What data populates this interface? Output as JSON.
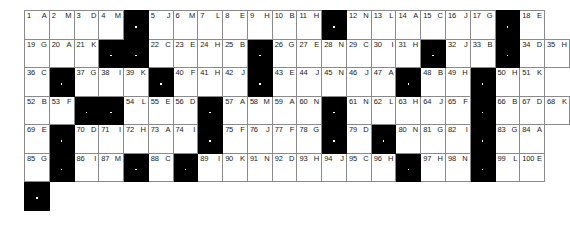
{
  "puzzle": {
    "type": "acrostic-grid",
    "title": "Acrostic Puzzle Grid",
    "columns": 20,
    "rows": 7,
    "cell_width_px": 26.8,
    "cell_height_px": 27.5,
    "origin_px": [
      24,
      10
    ],
    "colors": {
      "block": "#000000",
      "cell_fill": "#ffffff",
      "grid_line": "#8a8a8a",
      "text": "#1a1a1a"
    },
    "legend": {
      "number_position": "top-left",
      "clue_letter_position": "top-right"
    },
    "rows_data": [
      [
        {
          "n": "1",
          "c": "A"
        },
        {
          "n": "2",
          "c": "M"
        },
        {
          "n": "3",
          "c": "D"
        },
        {
          "n": "4",
          "c": "M"
        },
        {
          "blk": true
        },
        {
          "n": "5",
          "c": "J"
        },
        {
          "n": "6",
          "c": "M"
        },
        {
          "n": "7",
          "c": "L"
        },
        {
          "n": "8",
          "c": "E"
        },
        {
          "n": "9",
          "c": "H"
        },
        {
          "n": "10",
          "c": "B"
        },
        {
          "n": "11",
          "c": "H"
        },
        {
          "blk": true
        },
        {
          "n": "12",
          "c": "N"
        },
        {
          "n": "13",
          "c": "L"
        },
        {
          "n": "14",
          "c": "A"
        },
        {
          "n": "15",
          "c": "C"
        },
        {
          "n": "16",
          "c": "J"
        },
        {
          "n": "17",
          "c": "G"
        },
        {
          "blk": true
        },
        {
          "n": "18",
          "c": "E"
        }
      ],
      [
        {
          "n": "19",
          "c": "G"
        },
        {
          "n": "20",
          "c": "A"
        },
        {
          "n": "21",
          "c": "K"
        },
        {
          "blk": true
        },
        {
          "blk": true
        },
        {
          "n": "22",
          "c": "C"
        },
        {
          "n": "23",
          "c": "E"
        },
        {
          "n": "24",
          "c": "H"
        },
        {
          "n": "25",
          "c": "B"
        },
        {
          "blk": true
        },
        {
          "n": "26",
          "c": "G"
        },
        {
          "n": "27",
          "c": "E"
        },
        {
          "n": "28",
          "c": "N"
        },
        {
          "n": "29",
          "c": "C"
        },
        {
          "n": "30",
          "c": "I"
        },
        {
          "n": "31",
          "c": "H"
        },
        {
          "blk": true
        },
        {
          "n": "32",
          "c": "J"
        },
        {
          "n": "33",
          "c": "B"
        },
        {
          "blk": true
        },
        {
          "n": "34",
          "c": "D"
        },
        {
          "n": "35",
          "c": "H"
        }
      ],
      [
        {
          "n": "36",
          "c": "C"
        },
        {
          "blk": true
        },
        {
          "n": "37",
          "c": "G"
        },
        {
          "n": "38",
          "c": "I"
        },
        {
          "n": "39",
          "c": "K"
        },
        {
          "blk": true
        },
        {
          "n": "40",
          "c": "F"
        },
        {
          "n": "41",
          "c": "H"
        },
        {
          "n": "42",
          "c": "J"
        },
        {
          "blk": true
        },
        {
          "n": "43",
          "c": "E"
        },
        {
          "n": "44",
          "c": "J"
        },
        {
          "n": "45",
          "c": "N"
        },
        {
          "n": "46",
          "c": "J"
        },
        {
          "n": "47",
          "c": "A"
        },
        {
          "blk": true
        },
        {
          "n": "48",
          "c": "B"
        },
        {
          "n": "49",
          "c": "H"
        },
        {
          "blk": true
        },
        {
          "n": "50",
          "c": "H"
        },
        {
          "n": "51",
          "c": "K"
        }
      ],
      [
        {
          "n": "52",
          "c": "B"
        },
        {
          "n": "53",
          "c": "F"
        },
        {
          "blk": true
        },
        {
          "blk": true
        },
        {
          "n": "54",
          "c": "L"
        },
        {
          "n": "55",
          "c": "E"
        },
        {
          "n": "56",
          "c": "D"
        },
        {
          "blk": true
        },
        {
          "n": "57",
          "c": "A"
        },
        {
          "n": "58",
          "c": "M"
        },
        {
          "n": "59",
          "c": "A"
        },
        {
          "n": "60",
          "c": "N"
        },
        {
          "blk": true
        },
        {
          "n": "61",
          "c": "N"
        },
        {
          "n": "62",
          "c": "L"
        },
        {
          "n": "63",
          "c": "H"
        },
        {
          "n": "64",
          "c": "J"
        },
        {
          "n": "65",
          "c": "F"
        },
        {
          "blk": true
        },
        {
          "n": "66",
          "c": "B"
        },
        {
          "n": "67",
          "c": "D"
        },
        {
          "n": "68",
          "c": "K"
        }
      ],
      [
        {
          "n": "69",
          "c": "E"
        },
        {
          "blk": true
        },
        {
          "n": "70",
          "c": "D"
        },
        {
          "n": "71",
          "c": "I"
        },
        {
          "n": "72",
          "c": "H"
        },
        {
          "n": "73",
          "c": "A"
        },
        {
          "n": "74",
          "c": "I"
        },
        {
          "blk": true
        },
        {
          "n": "75",
          "c": "F"
        },
        {
          "n": "76",
          "c": "J"
        },
        {
          "n": "77",
          "c": "F"
        },
        {
          "n": "78",
          "c": "G"
        },
        {
          "blk": true
        },
        {
          "n": "79",
          "c": "D"
        },
        {
          "blk": true
        },
        {
          "n": "80",
          "c": "N"
        },
        {
          "n": "81",
          "c": "G"
        },
        {
          "n": "82",
          "c": "I"
        },
        {
          "blk": true
        },
        {
          "n": "83",
          "c": "G"
        },
        {
          "n": "84",
          "c": "A"
        }
      ],
      [
        {
          "n": "85",
          "c": "G"
        },
        {
          "blk": true
        },
        {
          "n": "86",
          "c": "I"
        },
        {
          "n": "87",
          "c": "M"
        },
        {
          "blk": true
        },
        {
          "n": "88",
          "c": "C"
        },
        {
          "blk": true
        },
        {
          "n": "89",
          "c": "I"
        },
        {
          "n": "90",
          "c": "K"
        },
        {
          "n": "91",
          "c": "N"
        },
        {
          "n": "92",
          "c": "D"
        },
        {
          "n": "93",
          "c": "H"
        },
        {
          "n": "94",
          "c": "J"
        },
        {
          "n": "95",
          "c": "C"
        },
        {
          "n": "96",
          "c": "H"
        },
        {
          "blk": true
        },
        {
          "n": "97",
          "c": "H"
        },
        {
          "n": "98",
          "c": "N"
        },
        {
          "blk": true
        },
        {
          "n": "99",
          "c": "L"
        },
        {
          "n": "100",
          "c": "E"
        }
      ],
      [
        {
          "blk": true
        },
        {
          "void": true
        },
        {
          "void": true
        },
        {
          "void": true
        },
        {
          "void": true
        },
        {
          "void": true
        },
        {
          "void": true
        },
        {
          "void": true
        },
        {
          "void": true
        },
        {
          "void": true
        },
        {
          "void": true
        },
        {
          "void": true
        },
        {
          "void": true
        },
        {
          "void": true
        },
        {
          "void": true
        },
        {
          "void": true
        },
        {
          "void": true
        },
        {
          "void": true
        },
        {
          "void": true
        },
        {
          "void": true
        },
        {
          "void": true
        }
      ]
    ]
  }
}
